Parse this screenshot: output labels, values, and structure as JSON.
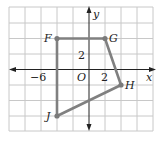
{
  "figure": {
    "axes": {
      "x_label": "x",
      "y_label": "y",
      "origin_label": "O"
    },
    "tick_labels": {
      "x_neg": "−6",
      "x_pos": "2",
      "y_pos": "2"
    },
    "units_per_cell": 2,
    "vertices": [
      {
        "name": "F",
        "x": -4,
        "y": 4
      },
      {
        "name": "G",
        "x": 2,
        "y": 4
      },
      {
        "name": "H",
        "x": 4,
        "y": -2
      },
      {
        "name": "J",
        "x": -4,
        "y": -6
      }
    ],
    "colors": {
      "grid": "#c8c8c8",
      "axis": "#222222",
      "polygon": "#808080",
      "point": "#7a7a7a"
    }
  }
}
